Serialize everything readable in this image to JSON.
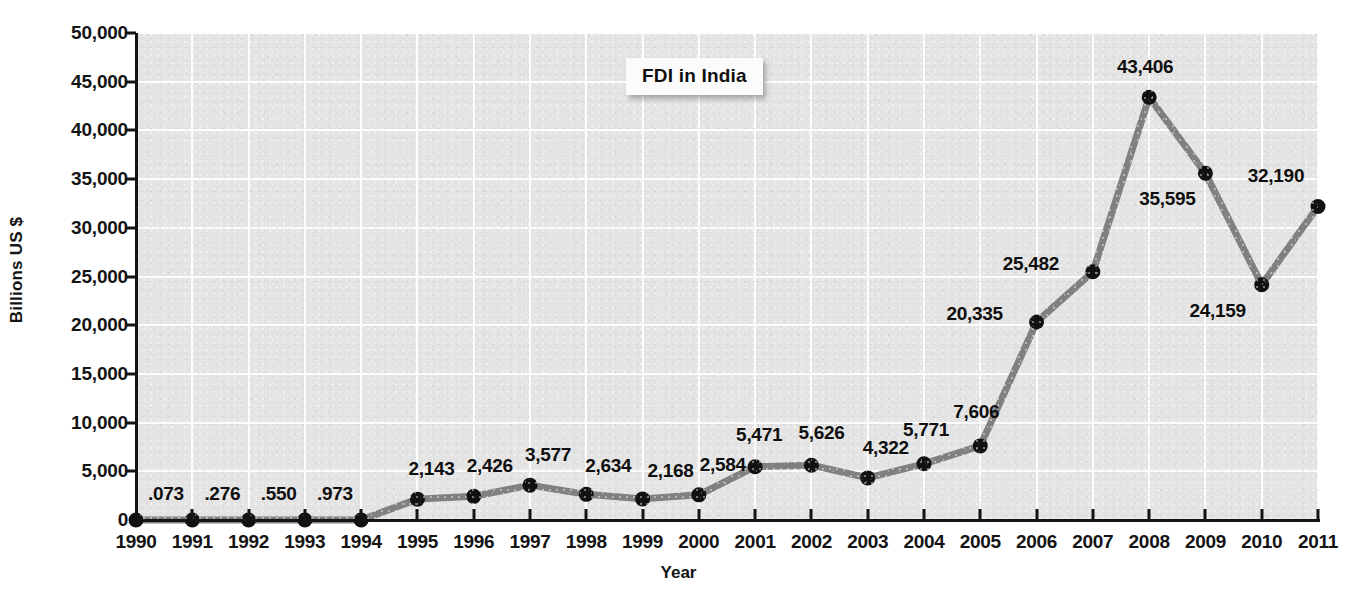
{
  "chart_data": {
    "type": "line",
    "title": "FDI in India",
    "xlabel": "Year",
    "ylabel": "Billions US $",
    "categories": [
      "1990",
      "1991",
      "1992",
      "1993",
      "1994",
      "1995",
      "1996",
      "1997",
      "1998",
      "1999",
      "2000",
      "2001",
      "2002",
      "2003",
      "2004",
      "2005",
      "2006",
      "2007",
      "2008",
      "2009",
      "2010",
      "2011"
    ],
    "values": [
      0.073,
      0.276,
      0.55,
      0.973,
      0.973,
      2143,
      2426,
      3577,
      2634,
      2168,
      2584,
      5471,
      5626,
      4322,
      5771,
      7606,
      20335,
      25482,
      43406,
      35595,
      24159,
      32190
    ],
    "point_labels": [
      ".073",
      ".276",
      ".550",
      ".973",
      "",
      "2,143",
      "2,426",
      "3,577",
      "2,634",
      "2,168",
      "2,584",
      "5,471",
      "5,626",
      "4,322",
      "5,771",
      "7,606",
      "20,335",
      "25,482",
      "43,406",
      "35,595",
      "24,159",
      "32,190"
    ],
    "ylim": [
      0,
      50000
    ],
    "yticks": [
      0,
      5000,
      10000,
      15000,
      20000,
      25000,
      30000,
      35000,
      40000,
      45000,
      50000
    ],
    "ytick_labels": [
      "0",
      "5,000",
      "10,000",
      "15,000",
      "20,000",
      "25,000",
      "30,000",
      "35,000",
      "40,000",
      "45,000",
      "50,000"
    ],
    "grid": true,
    "legend": false,
    "series_color": "#808080",
    "marker_color": "#111111",
    "plot_bg_color": "#e4e4e4",
    "gridline_color": "#fdfdfd",
    "axis_color": "#141414",
    "title_bg_color": "#fbfbfb"
  }
}
